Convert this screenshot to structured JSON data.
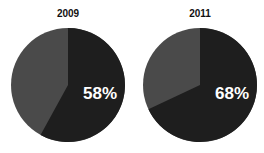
{
  "chart_data": [
    {
      "type": "pie",
      "title": "2009",
      "slices": [
        {
          "label": "highlighted",
          "value": 58,
          "color": "#1e1e1e"
        },
        {
          "label": "rest",
          "value": 42,
          "color": "#4a4a4a"
        }
      ],
      "annotation": "58%"
    },
    {
      "type": "pie",
      "title": "2011",
      "slices": [
        {
          "label": "highlighted",
          "value": 68,
          "color": "#1e1e1e"
        },
        {
          "label": "rest",
          "value": 32,
          "color": "#4a4a4a"
        }
      ],
      "annotation": "68%"
    }
  ],
  "pies": [
    {
      "title": "2009",
      "label": "58%"
    },
    {
      "title": "2011",
      "label": "68%"
    }
  ]
}
